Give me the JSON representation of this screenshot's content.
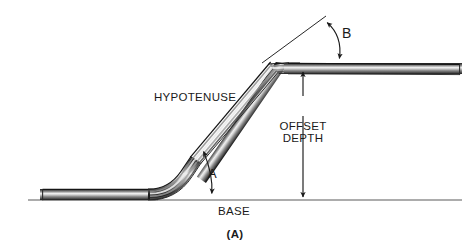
{
  "figure": {
    "caption": "(A)",
    "background_color": "#ffffff",
    "ink_color": "#1a1a1a"
  },
  "labels": {
    "hypotenuse": "HYPOTENUSE",
    "offset_depth_line1": "OFFSET",
    "offset_depth_line2": "DEPTH",
    "base": "BASE",
    "angle_a": "A",
    "angle_b": "B"
  },
  "geometry": {
    "base_line_y": 200,
    "base_line_x_start": 28,
    "base_line_x_end": 462,
    "lower_run_left_x": 42,
    "lower_bend_x": 150,
    "upper_bend_x": 288,
    "upper_run_right_x": 460,
    "upper_run_y": 68,
    "pipe_thickness": 11,
    "offset_depth_arrow_x": 303,
    "offset_depth_arrow_top_y": 68,
    "offset_depth_arrow_bottom_y": 200
  },
  "colors": {
    "pipe_edge_dark": "#1c1c1c",
    "pipe_body_mid": "#8a8a8a",
    "pipe_highlight": "#f2f2f2",
    "base_line": "#555555",
    "annotation_line": "#1a1a1a"
  }
}
